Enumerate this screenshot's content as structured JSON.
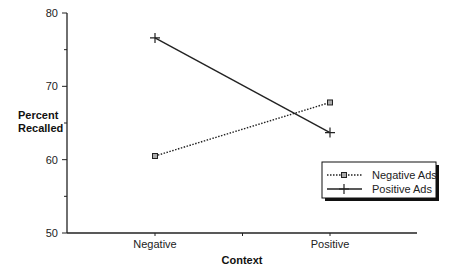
{
  "chart_data": {
    "type": "line",
    "title": "",
    "xlabel": "Context",
    "ylabel": "Percent Recalled",
    "ylabel_lines": [
      "Percent",
      "Recalled"
    ],
    "categories": [
      "Negative",
      "Positive"
    ],
    "ylim": [
      50,
      80
    ],
    "yticks": [
      50,
      60,
      70,
      80
    ],
    "yminor_ticks": [
      55,
      65,
      75
    ],
    "grid": false,
    "legend_position": "lower right",
    "series": [
      {
        "name": "Negative Ads",
        "values": [
          60.5,
          67.8
        ],
        "line_style": "dotted",
        "marker": "square"
      },
      {
        "name": "Positive Ads",
        "values": [
          76.6,
          63.7
        ],
        "line_style": "solid",
        "marker": "plus"
      }
    ]
  },
  "legend": {
    "items": [
      {
        "label": "Negative Ads"
      },
      {
        "label": "Positive Ads"
      }
    ]
  }
}
